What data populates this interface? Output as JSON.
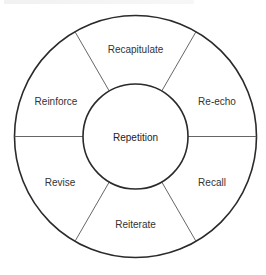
{
  "diagram": {
    "type": "ring-segments",
    "center": {
      "label": "Repetition"
    },
    "segments": [
      {
        "label": "Recapitulate",
        "position": "top"
      },
      {
        "label": "Re-echo",
        "position": "upper-right"
      },
      {
        "label": "Recall",
        "position": "lower-right"
      },
      {
        "label": "Reiterate",
        "position": "bottom"
      },
      {
        "label": "Revise",
        "position": "lower-left"
      },
      {
        "label": "Reinforce",
        "position": "upper-left"
      }
    ],
    "colors": {
      "stroke": "#2a2a2a",
      "divider": "#555555",
      "text": "#333333",
      "background": "#ffffff"
    }
  }
}
